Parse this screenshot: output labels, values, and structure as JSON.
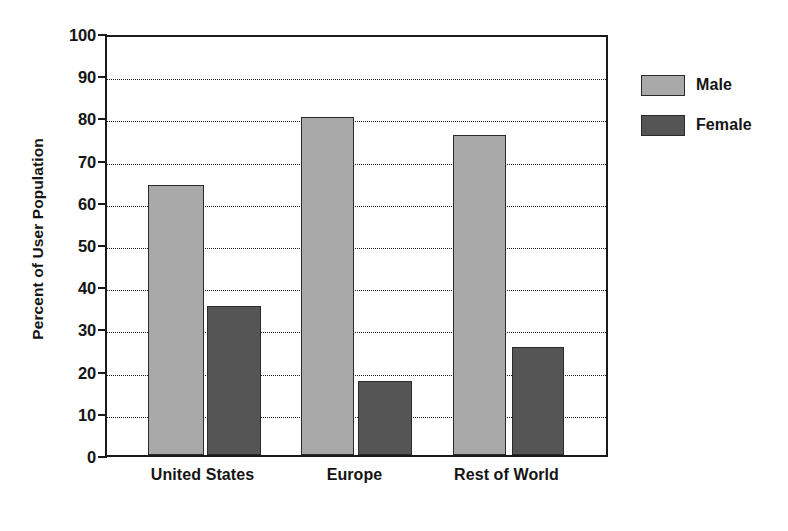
{
  "chart_data": {
    "type": "bar",
    "title": "",
    "subtitle": "",
    "xlabel": "",
    "ylabel": "Percent of User Population",
    "categories": [
      "United States",
      "Europe",
      "Rest of World"
    ],
    "series": [
      {
        "name": "Male",
        "color": "#a9a9a9",
        "values": [
          64.0,
          80.2,
          75.8
        ]
      },
      {
        "name": "Female",
        "color": "#555555",
        "values": [
          35.2,
          17.6,
          25.6
        ]
      }
    ],
    "ylim": [
      0,
      100
    ],
    "ytick_values": [
      0,
      10,
      20,
      30,
      40,
      50,
      60,
      70,
      80,
      90,
      100
    ],
    "ytick_labels": [
      "0",
      "10",
      "20",
      "30",
      "40",
      "50",
      "60",
      "70",
      "80",
      "90",
      "100"
    ],
    "grid": true,
    "grid_axis": "y",
    "grid_style": "dotted",
    "legend_position": "right",
    "legend_entries": [
      "Male",
      "Female"
    ],
    "bar_border_color": "#2b2b2b",
    "axis_color": "#1a1a1a",
    "background_color": "#ffffff"
  }
}
